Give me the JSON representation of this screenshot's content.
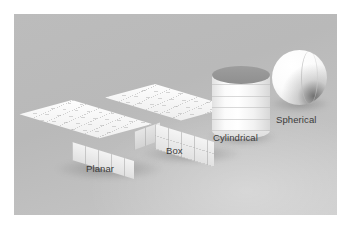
{
  "figure": {
    "name": "collider-shape-types-illustration",
    "panel_color": "#bcbcbc",
    "label_color": "#3b3b3b"
  },
  "shapes": [
    {
      "id": "planar",
      "label": "Planar",
      "geometry": "flat-slab-box",
      "surface_color": "#f4f4f4"
    },
    {
      "id": "box",
      "label": "Box",
      "geometry": "cuboid",
      "surface_color": "#f4f4f4"
    },
    {
      "id": "cylindrical",
      "label": "Cylindrical",
      "geometry": "cylinder",
      "surface_color": "#f8f8f8",
      "cap_color": "#969696"
    },
    {
      "id": "spherical",
      "label": "Spherical",
      "geometry": "sphere",
      "surface_color": "#fbfbfb"
    }
  ]
}
